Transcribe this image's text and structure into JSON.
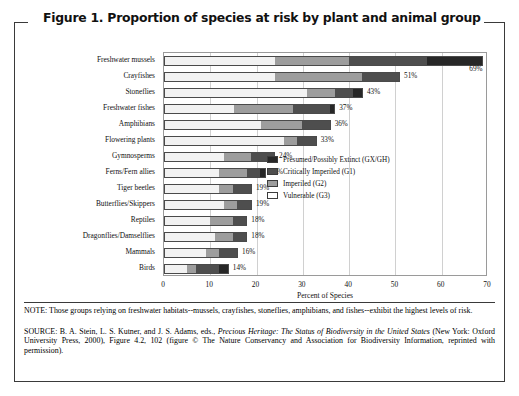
{
  "figure": {
    "title": "Figure 1. Proportion of species at risk by plant and animal group"
  },
  "chart_data": {
    "type": "bar",
    "orientation": "horizontal",
    "stacked": true,
    "title": "Figure 1. Proportion of species at risk by plant and animal group",
    "xlabel": "Percent of Species",
    "ylabel": "",
    "xlim": [
      0,
      70
    ],
    "xticks": [
      0,
      10,
      20,
      30,
      40,
      50,
      60,
      70
    ],
    "grid": true,
    "legend_position": "inside-center-right",
    "categories": [
      "Freshwater mussels",
      "Crayfishes",
      "Stoneflies",
      "Freshwater fishes",
      "Amphibians",
      "Flowering plants",
      "Gymnosperms",
      "Ferns/Fern allies",
      "Tiger beetles",
      "Butterflies/Skippers",
      "Reptiles",
      "Dragonflies/Damselflies",
      "Mammals",
      "Birds"
    ],
    "totals": [
      69,
      51,
      43,
      37,
      36,
      33,
      24,
      22,
      19,
      19,
      18,
      18,
      16,
      14
    ],
    "total_labels": [
      "69%",
      "51%",
      "43%",
      "37%",
      "36%",
      "33%",
      "24%",
      "22%",
      "19%",
      "19%",
      "18%",
      "18%",
      "16%",
      "14%"
    ],
    "series": [
      {
        "name": "Vulnerable (G3)",
        "key": "g3",
        "color": "#f2f2f2",
        "values": [
          24,
          24,
          31,
          15,
          21,
          26,
          13,
          12,
          12,
          13,
          10,
          11,
          9,
          5
        ]
      },
      {
        "name": "Imperiled (G2)",
        "key": "g2",
        "color": "#9d9d9d",
        "values": [
          16,
          19,
          6,
          13,
          9,
          3,
          6,
          6,
          3,
          3,
          5,
          4,
          3,
          2
        ]
      },
      {
        "name": "Critically Imperiled (G1)",
        "key": "g1",
        "color": "#4e4e4e",
        "values": [
          17,
          8,
          4,
          8,
          6,
          4,
          5,
          3,
          4,
          3,
          3,
          3,
          4,
          5
        ]
      },
      {
        "name": "Presumed/Possibly Extinct (GX/GH)",
        "key": "gx",
        "color": "#272727",
        "values": [
          12,
          0,
          2,
          1,
          0,
          0,
          0,
          1,
          0,
          0,
          0,
          0,
          0,
          2
        ]
      }
    ],
    "legend": [
      {
        "label": "Presumed/Possibly Extinct (GX/GH)",
        "color": "#272727"
      },
      {
        "label": "Critically Imperiled (G1)",
        "color": "#4e4e4e"
      },
      {
        "label": "Imperiled (G2)",
        "color": "#9d9d9d"
      },
      {
        "label": "Vulnerable (G3)",
        "color": "#ffffff"
      }
    ]
  },
  "notes": {
    "note_text": "NOTE: Those groups relying on freshwater habitats--mussels, crayfishes, stoneflies, amphibians, and fishes--exhibit the highest levels of risk.",
    "source_prefix": "SOURCE: B. A. Stein, L. S. Kutner, and J. S. Adams, eds., ",
    "source_italic": "Precious Heritage: The Status of Biodiversity in the United States",
    "source_suffix": " (New York: Oxford University Press, 2000), Figure 4.2, 102 (figure © The Nature Conservancy and Association for Biodiversity Information, reprinted with permission)."
  }
}
